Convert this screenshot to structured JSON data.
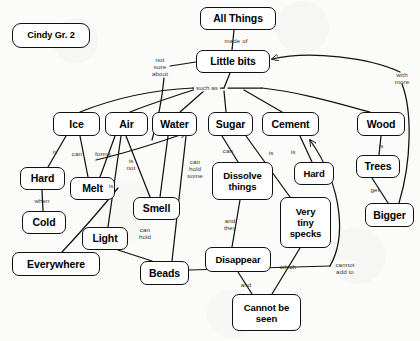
{
  "diagram": {
    "type": "concept-map",
    "title_node": "All Things",
    "author_tag": "Cindy Gr. 2",
    "colors": {
      "background": "#fbfbfa",
      "stroke": "#111111",
      "node_fill": "#ffffff",
      "text": "#000000",
      "label_text": "#333333"
    },
    "nodes": [
      {
        "id": "cindy",
        "label": "Cindy Gr. 2",
        "x": 12,
        "y": 23,
        "w": 78,
        "h": 25,
        "size": "tag"
      },
      {
        "id": "allthings",
        "label": "All Things",
        "x": 200,
        "y": 7,
        "w": 76,
        "h": 23,
        "size": "sz-lg"
      },
      {
        "id": "littlebits",
        "label": "Little bits",
        "x": 196,
        "y": 50,
        "w": 74,
        "h": 23,
        "size": "sz-lg"
      },
      {
        "id": "ice",
        "label": "Ice",
        "x": 53,
        "y": 112,
        "w": 47,
        "h": 24,
        "size": "sz-lg"
      },
      {
        "id": "air",
        "label": "Air",
        "x": 105,
        "y": 112,
        "w": 43,
        "h": 24,
        "size": "sz-lg"
      },
      {
        "id": "water",
        "label": "Water",
        "x": 152,
        "y": 112,
        "w": 45,
        "h": 24,
        "size": "sz-lg"
      },
      {
        "id": "sugar",
        "label": "Sugar",
        "x": 208,
        "y": 112,
        "w": 45,
        "h": 24,
        "size": "sz-lg"
      },
      {
        "id": "cement",
        "label": "Cement",
        "x": 262,
        "y": 112,
        "w": 57,
        "h": 24,
        "size": "sz-lg"
      },
      {
        "id": "wood",
        "label": "Wood",
        "x": 357,
        "y": 112,
        "w": 48,
        "h": 24,
        "size": "sz-lg"
      },
      {
        "id": "hard1",
        "label": "Hard",
        "x": 20,
        "y": 167,
        "w": 45,
        "h": 23,
        "size": "sz-lg"
      },
      {
        "id": "melt",
        "label": "Melt",
        "x": 70,
        "y": 177,
        "w": 45,
        "h": 23,
        "size": "sz-lg"
      },
      {
        "id": "cold",
        "label": "Cold",
        "x": 22,
        "y": 211,
        "w": 44,
        "h": 23,
        "size": "sz-lg"
      },
      {
        "id": "light",
        "label": "Light",
        "x": 82,
        "y": 227,
        "w": 46,
        "h": 23,
        "size": "sz-lg"
      },
      {
        "id": "everywhere",
        "label": "Everywhere",
        "x": 12,
        "y": 252,
        "w": 88,
        "h": 24,
        "size": "sz-lg"
      },
      {
        "id": "smell",
        "label": "Smell",
        "x": 133,
        "y": 197,
        "w": 47,
        "h": 23,
        "size": "sz-lg"
      },
      {
        "id": "beads",
        "label": "Beads",
        "x": 140,
        "y": 261,
        "w": 49,
        "h": 24,
        "size": "sz-lg"
      },
      {
        "id": "dissolve",
        "label": "Dissolve\nthings",
        "x": 212,
        "y": 162,
        "w": 61,
        "h": 38,
        "size": "sz-md"
      },
      {
        "id": "hard2",
        "label": "Hard",
        "x": 294,
        "y": 162,
        "w": 40,
        "h": 23,
        "size": "sz-md"
      },
      {
        "id": "specks",
        "label": "Very\ntiny\nspecks",
        "x": 280,
        "y": 197,
        "w": 51,
        "h": 51,
        "size": "sz-md"
      },
      {
        "id": "disappear",
        "label": "Disappear",
        "x": 205,
        "y": 247,
        "w": 66,
        "h": 25,
        "size": "sz-md"
      },
      {
        "id": "cannotseen",
        "label": "Cannot be\nseen",
        "x": 232,
        "y": 294,
        "w": 69,
        "h": 37,
        "size": "sz-md"
      },
      {
        "id": "trees",
        "label": "Trees",
        "x": 356,
        "y": 155,
        "w": 44,
        "h": 23,
        "size": "sz-lg"
      },
      {
        "id": "bigger",
        "label": "Bigger",
        "x": 365,
        "y": 203,
        "w": 49,
        "h": 24,
        "size": "sz-lg"
      }
    ],
    "edges": [
      {
        "id": "e1",
        "from": "allthings",
        "to": "littlebits",
        "label": "made of",
        "lx": 236,
        "ly": 41
      },
      {
        "id": "e2",
        "from": "littlebits",
        "to": "hub",
        "label": "such as",
        "lx": 207,
        "ly": 88
      },
      {
        "id": "e3",
        "from": "hub",
        "to": "ice",
        "label": "",
        "lx": 0,
        "ly": 0
      },
      {
        "id": "e4",
        "from": "hub",
        "to": "air",
        "label": "",
        "lx": 0,
        "ly": 0
      },
      {
        "id": "e5",
        "from": "hub",
        "to": "water",
        "label": "",
        "lx": 0,
        "ly": 0
      },
      {
        "id": "e6",
        "from": "hub",
        "to": "sugar",
        "label": "",
        "lx": 0,
        "ly": 0
      },
      {
        "id": "e7",
        "from": "hub",
        "to": "cement",
        "label": "",
        "lx": 0,
        "ly": 0
      },
      {
        "id": "e8",
        "from": "hub",
        "to": "wood",
        "label": "",
        "lx": 0,
        "ly": 0
      },
      {
        "id": "e9",
        "from": "littlebits",
        "to": "notsure",
        "label": "not\nsure\nabout",
        "lx": 160,
        "ly": 67
      },
      {
        "id": "e10",
        "from": "ice",
        "to": "hard1",
        "label": "is",
        "lx": 55,
        "ly": 152
      },
      {
        "id": "e11",
        "from": "ice",
        "to": "melt",
        "label": "can",
        "lx": 77,
        "ly": 154
      },
      {
        "id": "e12",
        "from": "air",
        "to": "melt",
        "label": "forms",
        "lx": 103,
        "ly": 154
      },
      {
        "id": "e13",
        "from": "hard1",
        "to": "cold",
        "label": "when",
        "lx": 42,
        "ly": 201
      },
      {
        "id": "e14",
        "from": "air",
        "to": "smell",
        "label": "is\nnot",
        "lx": 131,
        "ly": 164
      },
      {
        "id": "e15",
        "from": "air",
        "to": "light",
        "label": "is",
        "lx": 111,
        "ly": 186
      },
      {
        "id": "e16",
        "from": "light",
        "to": "beads",
        "label": "can\nhold",
        "lx": 145,
        "ly": 233
      },
      {
        "id": "e17",
        "from": "water",
        "to": "beads",
        "label": "can\nhold\nsome",
        "lx": 195,
        "ly": 169
      },
      {
        "id": "e18",
        "from": "water",
        "to": "smell",
        "label": "",
        "lx": 0,
        "ly": 0
      },
      {
        "id": "e19",
        "from": "melt",
        "to": "everywhere",
        "label": "",
        "lx": 0,
        "ly": 0
      },
      {
        "id": "e20",
        "from": "sugar",
        "to": "dissolve",
        "label": "can",
        "lx": 228,
        "ly": 151
      },
      {
        "id": "e21",
        "from": "sugar",
        "to": "specks",
        "label": "is",
        "lx": 271,
        "ly": 153
      },
      {
        "id": "e22",
        "from": "cement",
        "to": "hard2",
        "label": "is",
        "lx": 293,
        "ly": 152
      },
      {
        "id": "e23",
        "from": "dissolve",
        "to": "disappear",
        "label": "and\nthey",
        "lx": 230,
        "ly": 224
      },
      {
        "id": "e24",
        "from": "specks",
        "to": "cannotseen",
        "label": "which",
        "lx": 288,
        "ly": 267
      },
      {
        "id": "e25",
        "from": "disappear",
        "to": "cannotseen",
        "label": "and",
        "lx": 246,
        "ly": 285
      },
      {
        "id": "e26",
        "from": "beads",
        "to": "cement",
        "label": "cannot\nadd to",
        "lx": 343,
        "ly": 268
      },
      {
        "id": "e27",
        "from": "wood",
        "to": "trees",
        "label": "is",
        "lx": 381,
        "ly": 146
      },
      {
        "id": "e28",
        "from": "trees",
        "to": "bigger",
        "label": "get",
        "lx": 375,
        "ly": 190
      },
      {
        "id": "e29",
        "from": "bigger",
        "to": "littlebits",
        "label": "with\nmore",
        "lx": 400,
        "ly": 78
      }
    ],
    "arrowheads": [
      {
        "id": "a1",
        "target": "littlebits",
        "note": "arrow into Little bits from Bigger curve"
      },
      {
        "id": "a2",
        "target": "water",
        "note": "arrow into Water from left"
      },
      {
        "id": "a3",
        "target": "cement",
        "note": "arrow into Cement from Beads curve"
      }
    ]
  }
}
